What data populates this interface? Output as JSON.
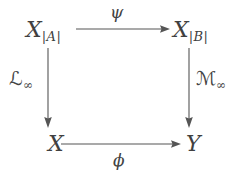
{
  "figure": {
    "kind": "commutative-diagram",
    "shape": "square",
    "background_color": "#ffffff",
    "ink_color": "#555555",
    "text_color": "#404040"
  },
  "nodes": {
    "top_left": {
      "base": "X",
      "subscript": "|A|"
    },
    "top_right": {
      "base": "X",
      "subscript": "|B|"
    },
    "bottom_left": {
      "base": "X",
      "subscript": ""
    },
    "bottom_right": {
      "base": "Y",
      "subscript": ""
    }
  },
  "arrows": {
    "top": {
      "label": "ψ",
      "from": "X_{|A|}",
      "to": "X_{|B|}",
      "direction": "right",
      "label_position": "above"
    },
    "bottom": {
      "label": "ϕ",
      "from": "X",
      "to": "Y",
      "direction": "right",
      "label_position": "below"
    },
    "left": {
      "label_base": "ℒ",
      "label_subscript": "∞",
      "from": "X_{|A|}",
      "to": "X",
      "direction": "down",
      "label_position": "left"
    },
    "right": {
      "label_base": "ℳ",
      "label_subscript": "∞",
      "from": "X_{|B|}",
      "to": "Y",
      "direction": "down",
      "label_position": "right"
    }
  }
}
